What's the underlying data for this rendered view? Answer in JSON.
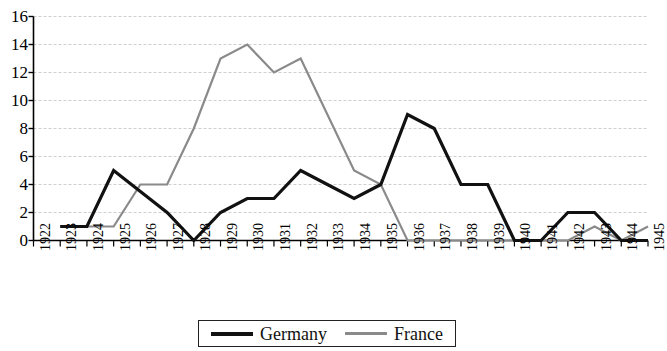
{
  "chart_data": {
    "type": "line",
    "title": "",
    "subtitle": "",
    "xlabel": "",
    "ylabel": "",
    "grid": true,
    "legend_position": "bottom-center",
    "ylim": [
      0,
      16
    ],
    "yticks": [
      0,
      2,
      4,
      6,
      8,
      10,
      12,
      14,
      16
    ],
    "categories": [
      "1922",
      "1923",
      "1924",
      "1925",
      "1926",
      "1927",
      "1928",
      "1929",
      "1930",
      "1931",
      "1932",
      "1933",
      "1934",
      "1935",
      "1936",
      "1937",
      "1938",
      "1939",
      "1940",
      "1941",
      "1942",
      "1943",
      "1944",
      "1945"
    ],
    "series": [
      {
        "name": "Germany",
        "color": "#111111",
        "width": 3.2,
        "values": [
          null,
          1,
          1,
          5,
          3.5,
          2,
          0,
          2,
          3,
          3,
          5,
          4,
          3,
          4,
          9,
          8,
          4,
          4,
          0,
          0,
          2,
          2,
          0,
          0
        ]
      },
      {
        "name": "France",
        "color": "#8a8a8a",
        "width": 2.2,
        "values": [
          null,
          1,
          1,
          1,
          4,
          4,
          8,
          13,
          14,
          12,
          13,
          9,
          5,
          4,
          0,
          0,
          0,
          0,
          0,
          0,
          0,
          1,
          0,
          1
        ]
      }
    ]
  },
  "legend": {
    "items": [
      {
        "label": "Germany",
        "key": "germany"
      },
      {
        "label": "France",
        "key": "france"
      }
    ]
  }
}
